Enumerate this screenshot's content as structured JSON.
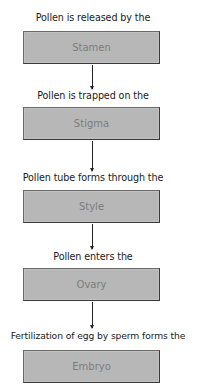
{
  "diagram": {
    "type": "flowchart",
    "direction": "top-to-bottom",
    "steps": [
      {
        "label": "Pollen is released by the",
        "box": "Stamen"
      },
      {
        "label": "Pollen is trapped on the",
        "box": "Stigma"
      },
      {
        "label": "Pollen tube forms through the",
        "box": "Style"
      },
      {
        "label": "Pollen enters the",
        "box": "Ovary"
      },
      {
        "label": "Fertilization of egg by sperm forms the",
        "box": "Embryo"
      }
    ],
    "colors": {
      "box_fill": "#b7b7b7",
      "box_border": "#3a3a3a",
      "box_text": "#7d7d7d",
      "label_text": "#1a1a1a",
      "arrow": "#222222"
    }
  }
}
